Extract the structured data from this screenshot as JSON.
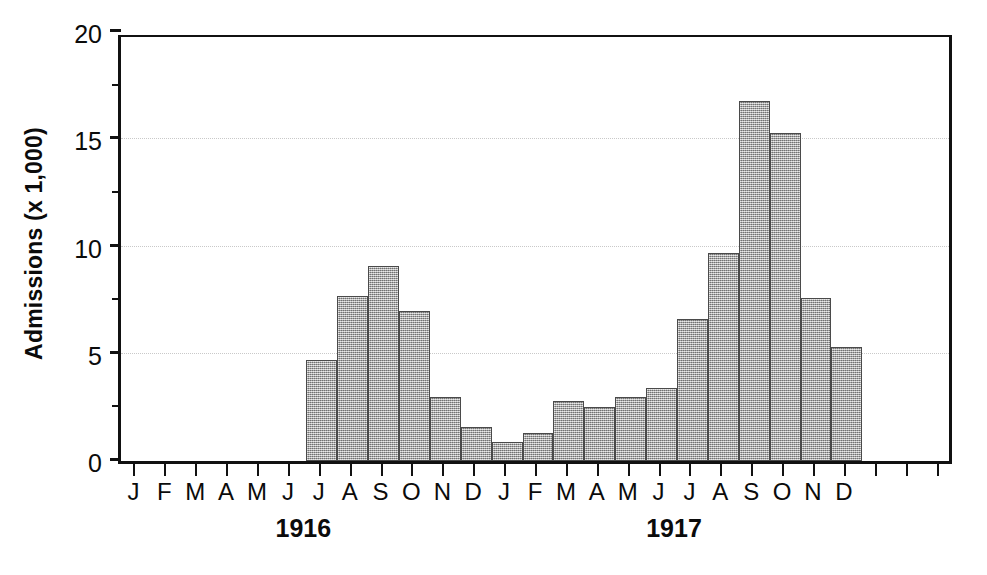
{
  "chart_data": {
    "type": "bar",
    "title": "",
    "subtitle": "",
    "xlabel": "",
    "ylabel": "Admissions (x 1,000)",
    "ylim": [
      0,
      20
    ],
    "ytick_labels": [
      "0",
      "5",
      "10",
      "15",
      "20"
    ],
    "ytick_values": [
      0,
      5,
      10,
      15,
      20
    ],
    "yminor_ticks": [
      2.5,
      7.5,
      12.5,
      17.5
    ],
    "grid": "horizontal-dotted",
    "legend": null,
    "bar_color": "#a8a8a8",
    "bar_edge_color": "#4a4a4a",
    "axis_color": "#111111",
    "grid_color": "#c9c9c9",
    "categories": [
      "J",
      "F",
      "M",
      "A",
      "M",
      "J",
      "J",
      "A",
      "S",
      "O",
      "N",
      "D",
      "J",
      "F",
      "M",
      "A",
      "M",
      "J",
      "J",
      "A",
      "S",
      "O",
      "N",
      "D"
    ],
    "values": [
      0,
      0,
      0,
      0,
      0,
      0,
      4.7,
      7.7,
      9.1,
      7.0,
      3.0,
      1.6,
      0.9,
      1.3,
      2.8,
      2.5,
      3.0,
      3.4,
      6.6,
      9.7,
      16.8,
      15.3,
      7.6,
      5.3
    ],
    "groups": [
      {
        "label": "1916",
        "start_index": 0,
        "end_index": 11
      },
      {
        "label": "1917",
        "start_index": 12,
        "end_index": 23
      }
    ],
    "n_slots": 27
  }
}
